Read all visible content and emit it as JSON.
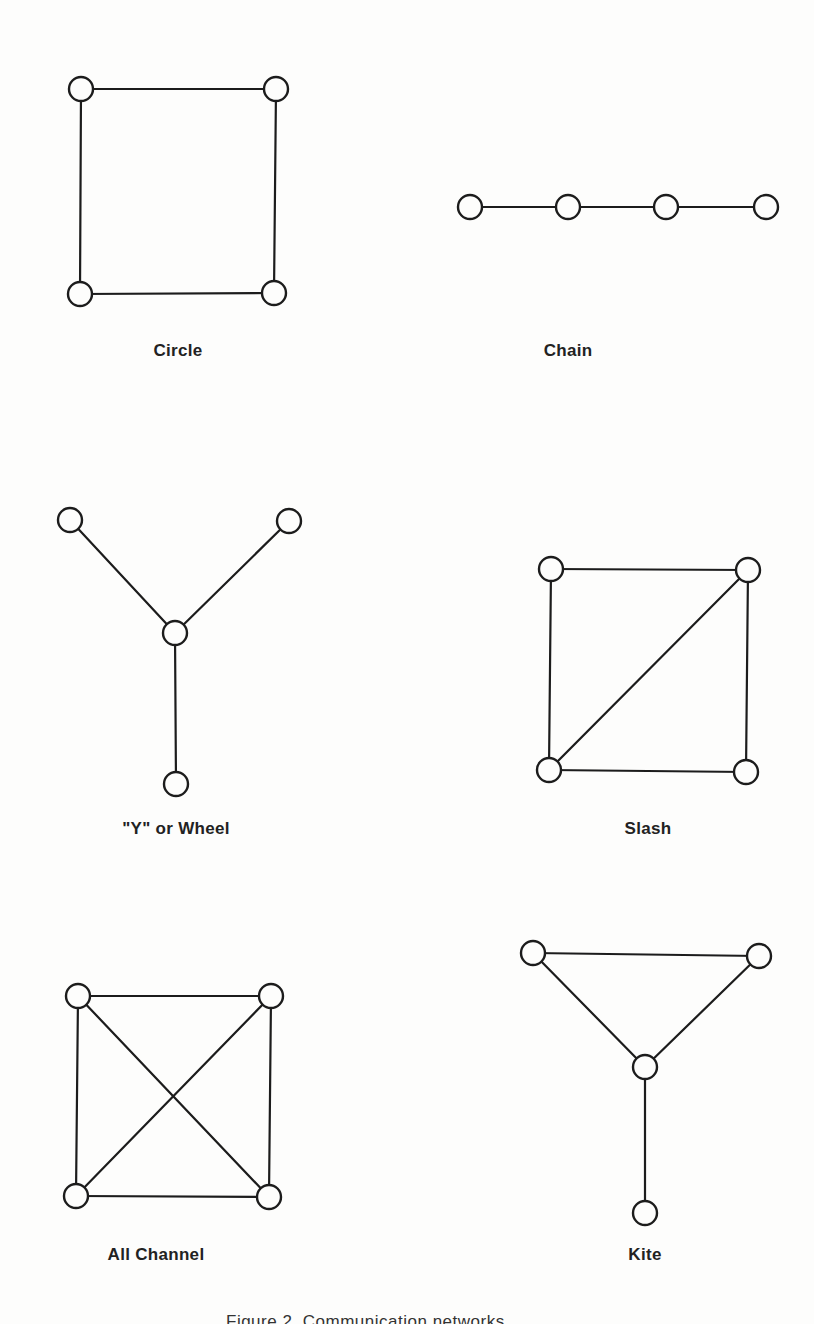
{
  "figure": {
    "caption": "Figure 2.  Communication networks",
    "colors": {
      "background": "#fdfdfc",
      "ink": "#1c1c1c"
    },
    "node_radius": 12
  },
  "networks": [
    {
      "id": "circle",
      "label": "Circle",
      "label_pos": [
        178,
        353
      ],
      "nodes": [
        [
          81,
          89
        ],
        [
          276,
          89
        ],
        [
          274,
          293
        ],
        [
          80,
          294
        ]
      ],
      "edges": [
        [
          0,
          1
        ],
        [
          1,
          2
        ],
        [
          2,
          3
        ],
        [
          3,
          0
        ]
      ]
    },
    {
      "id": "chain",
      "label": "Chain",
      "label_pos": [
        568,
        353
      ],
      "nodes": [
        [
          470,
          207
        ],
        [
          568,
          207
        ],
        [
          666,
          207
        ],
        [
          766,
          207
        ]
      ],
      "edges": [
        [
          0,
          1
        ],
        [
          1,
          2
        ],
        [
          2,
          3
        ]
      ]
    },
    {
      "id": "y-wheel",
      "label": "\"Y\" or Wheel",
      "label_pos": [
        176,
        831
      ],
      "nodes": [
        [
          70,
          520
        ],
        [
          289,
          521
        ],
        [
          175,
          633
        ],
        [
          176,
          784
        ]
      ],
      "edges": [
        [
          0,
          2
        ],
        [
          1,
          2
        ],
        [
          2,
          3
        ]
      ]
    },
    {
      "id": "slash",
      "label": "Slash",
      "label_pos": [
        648,
        831
      ],
      "nodes": [
        [
          551,
          569
        ],
        [
          748,
          570
        ],
        [
          746,
          772
        ],
        [
          549,
          770
        ]
      ],
      "edges": [
        [
          0,
          1
        ],
        [
          1,
          2
        ],
        [
          2,
          3
        ],
        [
          3,
          0
        ],
        [
          3,
          1
        ]
      ]
    },
    {
      "id": "all-channel",
      "label": "All Channel",
      "label_pos": [
        156,
        1257
      ],
      "nodes": [
        [
          78,
          996
        ],
        [
          271,
          996
        ],
        [
          269,
          1197
        ],
        [
          76,
          1196
        ]
      ],
      "edges": [
        [
          0,
          1
        ],
        [
          1,
          2
        ],
        [
          2,
          3
        ],
        [
          3,
          0
        ],
        [
          0,
          2
        ],
        [
          1,
          3
        ]
      ]
    },
    {
      "id": "kite",
      "label": "Kite",
      "label_pos": [
        645,
        1257
      ],
      "nodes": [
        [
          533,
          953
        ],
        [
          759,
          956
        ],
        [
          645,
          1067
        ],
        [
          645,
          1213
        ]
      ],
      "edges": [
        [
          0,
          1
        ],
        [
          0,
          2
        ],
        [
          1,
          2
        ],
        [
          2,
          3
        ]
      ]
    }
  ]
}
